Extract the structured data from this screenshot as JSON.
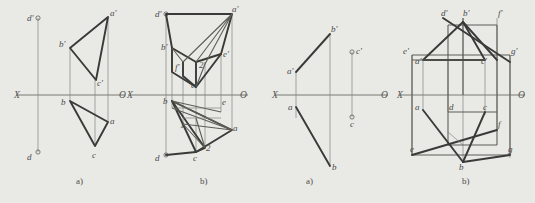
{
  "document": {
    "type": "engineering-drawing",
    "description": "Descriptive geometry orthographic projection exercises, two figure pairs",
    "background_color": "#e9e9e6",
    "line_color": "#3a3a38",
    "axis_color": "#6e6e67"
  },
  "figures": [
    {
      "id": "fig1a",
      "caption": "a)",
      "axis": {
        "left_label": "X",
        "right_label": "O"
      },
      "points": [
        {
          "name": "d-prime",
          "label": "d'"
        },
        {
          "name": "a-prime",
          "label": "a'"
        },
        {
          "name": "b-prime",
          "label": "b'"
        },
        {
          "name": "c-prime",
          "label": "c'"
        },
        {
          "name": "b",
          "label": "b"
        },
        {
          "name": "a",
          "label": "a"
        },
        {
          "name": "c",
          "label": "c"
        },
        {
          "name": "d",
          "label": "d"
        }
      ]
    },
    {
      "id": "fig1b",
      "caption": "b)",
      "axis": {
        "left_label": "X",
        "right_label": "O"
      },
      "points": [
        {
          "name": "d-prime",
          "label": "d'"
        },
        {
          "name": "a-prime",
          "label": "a'"
        },
        {
          "name": "b-prime",
          "label": "b'"
        },
        {
          "name": "e-prime",
          "label": "e'"
        },
        {
          "name": "f-prime",
          "label": "f'"
        },
        {
          "name": "two-prime",
          "label": "2'"
        },
        {
          "name": "c-prime",
          "label": "c'"
        },
        {
          "name": "b",
          "label": "b"
        },
        {
          "name": "one",
          "label": "1"
        },
        {
          "name": "e",
          "label": "e"
        },
        {
          "name": "a",
          "label": "a"
        },
        {
          "name": "two",
          "label": "2"
        },
        {
          "name": "c",
          "label": "c"
        },
        {
          "name": "d",
          "label": "d"
        }
      ]
    },
    {
      "id": "fig2a",
      "caption": "a)",
      "axis": {
        "left_label": "X",
        "right_label": "O"
      },
      "points": [
        {
          "name": "b-prime",
          "label": "b'"
        },
        {
          "name": "a-prime",
          "label": "a'"
        },
        {
          "name": "c-prime",
          "label": "c'"
        },
        {
          "name": "a",
          "label": "a"
        },
        {
          "name": "c",
          "label": "c"
        },
        {
          "name": "b",
          "label": "b"
        }
      ]
    },
    {
      "id": "fig2b",
      "caption": "b)",
      "axis": {
        "left_label": "X",
        "right_label": "O"
      },
      "points": [
        {
          "name": "d-prime",
          "label": "d'"
        },
        {
          "name": "b-prime",
          "label": "b'"
        },
        {
          "name": "f-prime",
          "label": "f'"
        },
        {
          "name": "e-prime",
          "label": "e'"
        },
        {
          "name": "a-prime",
          "label": "a'"
        },
        {
          "name": "c-prime",
          "label": "c'"
        },
        {
          "name": "g-prime",
          "label": "g'"
        },
        {
          "name": "a",
          "label": "a"
        },
        {
          "name": "d",
          "label": "d"
        },
        {
          "name": "c",
          "label": "c"
        },
        {
          "name": "f",
          "label": "f"
        },
        {
          "name": "e",
          "label": "e"
        },
        {
          "name": "b",
          "label": "b"
        },
        {
          "name": "g",
          "label": "g"
        }
      ]
    }
  ]
}
